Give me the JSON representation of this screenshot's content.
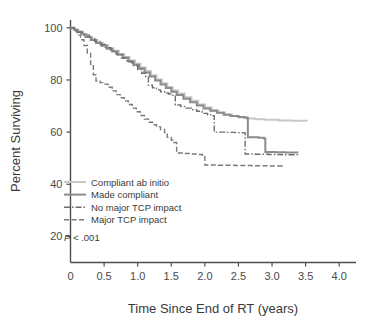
{
  "chart_data": {
    "type": "line",
    "title": "",
    "subtitle": "",
    "xlabel": "Time Since End of RT (years)",
    "ylabel": "Percent Surviving",
    "xlim": [
      0,
      4.25
    ],
    "ylim": [
      10,
      103
    ],
    "grid": false,
    "legend_position": "inside-lower-left",
    "xticks": [
      0,
      0.5,
      1.0,
      1.5,
      2.0,
      2.5,
      3.0,
      3.5,
      4.0
    ],
    "xtick_labels": [
      "0",
      "0.5",
      "1.0",
      "1.5",
      "2.0",
      "2.5",
      "3.0",
      "3.5",
      "4.0"
    ],
    "yticks": [
      20,
      40,
      60,
      80,
      100
    ],
    "ytick_labels": [
      "20",
      "40",
      "60",
      "80",
      "100"
    ],
    "annotations": [
      {
        "name": "p-value",
        "text_italic": "P",
        "text": " < .001",
        "x": 0.08,
        "y": 22
      }
    ],
    "series": [
      {
        "name": "Compliant ab initio",
        "color": "#c8c8c8",
        "dash": "none",
        "stroke_width": 2.0,
        "points": [
          [
            0.0,
            100.0
          ],
          [
            0.06,
            99.4
          ],
          [
            0.12,
            98.6
          ],
          [
            0.18,
            97.6
          ],
          [
            0.24,
            96.6
          ],
          [
            0.32,
            95.4
          ],
          [
            0.4,
            94.3
          ],
          [
            0.48,
            93.3
          ],
          [
            0.56,
            92.2
          ],
          [
            0.64,
            91.2
          ],
          [
            0.72,
            90.0
          ],
          [
            0.8,
            88.8
          ],
          [
            0.88,
            87.5
          ],
          [
            0.96,
            86.2
          ],
          [
            1.04,
            84.8
          ],
          [
            1.12,
            83.4
          ],
          [
            1.2,
            81.8
          ],
          [
            1.28,
            80.2
          ],
          [
            1.36,
            78.7
          ],
          [
            1.44,
            77.3
          ],
          [
            1.52,
            76.0
          ],
          [
            1.6,
            74.8
          ],
          [
            1.7,
            73.4
          ],
          [
            1.8,
            72.0
          ],
          [
            1.9,
            70.6
          ],
          [
            2.0,
            69.4
          ],
          [
            2.1,
            68.4
          ],
          [
            2.2,
            67.5
          ],
          [
            2.3,
            66.8
          ],
          [
            2.4,
            66.2
          ],
          [
            2.5,
            65.7
          ],
          [
            2.62,
            65.2
          ],
          [
            2.75,
            64.9
          ],
          [
            2.9,
            64.7
          ],
          [
            3.1,
            64.5
          ],
          [
            3.3,
            64.4
          ],
          [
            3.52,
            64.3
          ]
        ]
      },
      {
        "name": "Made compliant",
        "color": "#8c8c8c",
        "dash": "none",
        "stroke_width": 2.0,
        "points": [
          [
            0.0,
            100.0
          ],
          [
            0.05,
            99.3
          ],
          [
            0.1,
            98.5
          ],
          [
            0.16,
            97.5
          ],
          [
            0.22,
            96.5
          ],
          [
            0.3,
            95.3
          ],
          [
            0.38,
            94.2
          ],
          [
            0.46,
            93.1
          ],
          [
            0.54,
            92.0
          ],
          [
            0.62,
            90.9
          ],
          [
            0.7,
            89.7
          ],
          [
            0.78,
            88.5
          ],
          [
            0.86,
            87.2
          ],
          [
            0.94,
            85.8
          ],
          [
            1.02,
            84.4
          ],
          [
            1.1,
            82.9
          ],
          [
            1.18,
            81.3
          ],
          [
            1.26,
            79.8
          ],
          [
            1.34,
            78.3
          ],
          [
            1.42,
            76.9
          ],
          [
            1.5,
            75.5
          ],
          [
            1.58,
            74.2
          ],
          [
            1.68,
            72.8
          ],
          [
            1.78,
            71.5
          ],
          [
            1.88,
            70.2
          ],
          [
            1.98,
            69.1
          ],
          [
            2.08,
            68.2
          ],
          [
            2.18,
            67.4
          ],
          [
            2.28,
            66.7
          ],
          [
            2.38,
            66.2
          ],
          [
            2.5,
            65.8
          ],
          [
            2.58,
            65.6
          ],
          [
            2.62,
            65.5
          ],
          [
            2.64,
            58.0
          ],
          [
            2.8,
            57.8
          ],
          [
            2.88,
            57.6
          ],
          [
            2.9,
            52.4
          ],
          [
            3.05,
            52.3
          ],
          [
            3.2,
            52.2
          ],
          [
            3.38,
            52.1
          ]
        ]
      },
      {
        "name": "No major TCP impact",
        "color": "#6e6e6e",
        "dash": "dashdot",
        "stroke_width": 1.4,
        "points": [
          [
            0.0,
            100.0
          ],
          [
            0.06,
            99.2
          ],
          [
            0.12,
            98.3
          ],
          [
            0.2,
            97.2
          ],
          [
            0.28,
            96.0
          ],
          [
            0.36,
            94.8
          ],
          [
            0.44,
            93.6
          ],
          [
            0.52,
            92.4
          ],
          [
            0.6,
            91.1
          ],
          [
            0.68,
            89.8
          ],
          [
            0.76,
            88.4
          ],
          [
            0.84,
            87.0
          ],
          [
            0.92,
            85.5
          ],
          [
            1.0,
            84.0
          ],
          [
            1.06,
            82.6
          ],
          [
            1.12,
            81.2
          ],
          [
            1.16,
            78.0
          ],
          [
            1.22,
            77.0
          ],
          [
            1.28,
            76.2
          ],
          [
            1.34,
            75.5
          ],
          [
            1.4,
            75.0
          ],
          [
            1.46,
            74.6
          ],
          [
            1.52,
            74.2
          ],
          [
            1.56,
            70.4
          ],
          [
            1.64,
            69.8
          ],
          [
            1.72,
            69.2
          ],
          [
            1.8,
            68.6
          ],
          [
            1.88,
            68.0
          ],
          [
            1.96,
            67.2
          ],
          [
            2.04,
            66.6
          ],
          [
            2.1,
            66.3
          ],
          [
            2.14,
            60.0
          ],
          [
            2.3,
            59.9
          ],
          [
            2.45,
            59.8
          ],
          [
            2.56,
            59.7
          ],
          [
            2.6,
            51.6
          ],
          [
            2.75,
            51.5
          ],
          [
            2.95,
            51.4
          ],
          [
            3.15,
            51.3
          ],
          [
            3.38,
            51.2
          ]
        ]
      },
      {
        "name": "Major TCP impact",
        "color": "#7a7a7a",
        "dash": "dashed",
        "stroke_width": 1.4,
        "points": [
          [
            0.0,
            100.0
          ],
          [
            0.05,
            98.8
          ],
          [
            0.1,
            97.2
          ],
          [
            0.15,
            95.4
          ],
          [
            0.2,
            93.2
          ],
          [
            0.25,
            90.2
          ],
          [
            0.3,
            86.0
          ],
          [
            0.34,
            82.0
          ],
          [
            0.38,
            79.6
          ],
          [
            0.44,
            79.0
          ],
          [
            0.5,
            78.4
          ],
          [
            0.56,
            77.2
          ],
          [
            0.62,
            75.8
          ],
          [
            0.68,
            74.4
          ],
          [
            0.74,
            73.2
          ],
          [
            0.8,
            72.0
          ],
          [
            0.86,
            70.6
          ],
          [
            0.92,
            69.2
          ],
          [
            0.98,
            67.8
          ],
          [
            1.04,
            66.4
          ],
          [
            1.1,
            65.0
          ],
          [
            1.16,
            63.8
          ],
          [
            1.22,
            62.8
          ],
          [
            1.28,
            62.0
          ],
          [
            1.34,
            61.0
          ],
          [
            1.4,
            59.8
          ],
          [
            1.44,
            58.0
          ],
          [
            1.5,
            57.0
          ],
          [
            1.54,
            56.0
          ],
          [
            1.58,
            52.0
          ],
          [
            1.7,
            51.8
          ],
          [
            1.8,
            51.6
          ],
          [
            1.9,
            51.4
          ],
          [
            1.96,
            51.2
          ],
          [
            2.0,
            47.4
          ],
          [
            2.2,
            47.3
          ],
          [
            2.45,
            47.2
          ],
          [
            2.7,
            47.1
          ],
          [
            2.95,
            47.0
          ],
          [
            3.15,
            46.9
          ]
        ]
      }
    ]
  },
  "legend": {
    "items": [
      {
        "label": "Compliant ab initio"
      },
      {
        "label": "Made compliant"
      },
      {
        "label": "No major TCP impact"
      },
      {
        "label": "Major TCP impact"
      }
    ]
  },
  "axes": {
    "y_title": "Percent Surviving",
    "x_title": "Time Since End of RT (years)"
  }
}
